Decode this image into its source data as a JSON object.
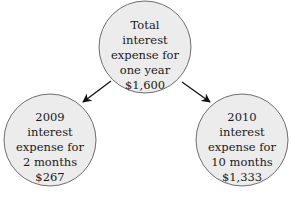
{
  "diagram": {
    "colors": {
      "circle_fill": "#ececec",
      "circle_stroke": "#6e6e6e",
      "arrow": "#111111",
      "text": "#1a1a1a"
    },
    "nodes": [
      {
        "id": "total",
        "lines": [
          "Total",
          "interest",
          "expense for",
          "one year",
          "$1,600"
        ]
      },
      {
        "id": "year-2009",
        "lines": [
          "2009",
          "interest",
          "expense for",
          "2 months",
          "$267"
        ]
      },
      {
        "id": "year-2010",
        "lines": [
          "2010",
          "interest",
          "expense for",
          "10 months",
          "$1,333"
        ]
      }
    ],
    "edges": [
      {
        "from": "total",
        "to": "year-2009"
      },
      {
        "from": "total",
        "to": "year-2010"
      }
    ]
  }
}
